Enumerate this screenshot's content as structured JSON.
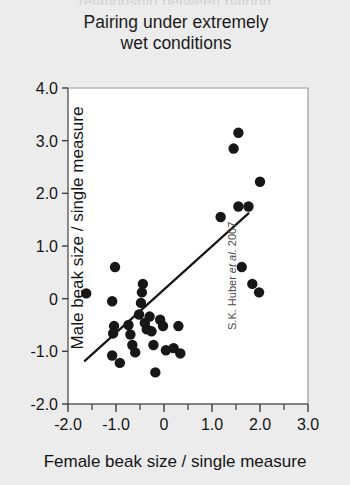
{
  "figure": {
    "clipped_header": "relationship between pairing",
    "title_line1": "Pairing under extremely",
    "title_line2": "wet conditions",
    "attribution_prefix": "S.K. Huber ",
    "attribution_italic": "et al.",
    "attribution_suffix": " 2007",
    "background_color": "#ececed",
    "plot_background_color": "#ffffff",
    "point_color": "#171717",
    "line_color": "#151515"
  },
  "chart_data": {
    "type": "scatter",
    "title": "Pairing under extremely wet conditions",
    "xlabel": "Female beak size / single measure",
    "ylabel": "Male beak size / single measure",
    "xlim": [
      -2.0,
      3.0
    ],
    "ylim": [
      -2.0,
      4.0
    ],
    "xticks": [
      -2.0,
      -1.5,
      -1.0,
      -0.5,
      0,
      0.5,
      1.0,
      1.5,
      2.0,
      2.5,
      3.0
    ],
    "xtick_labels": [
      "-2.0",
      "",
      "-1.0",
      "",
      "0",
      "",
      "1.0",
      "",
      "2.0",
      "",
      "3.0"
    ],
    "yticks": [
      -2.0,
      -1.0,
      0,
      1.0,
      2.0,
      3.0,
      4.0
    ],
    "ytick_labels": [
      "-2.0",
      "-1.0",
      "0",
      "1.0",
      "2.0",
      "3.0",
      "4.0"
    ],
    "grid": false,
    "legend": null,
    "annotation": "S.K. Huber et al. 2007",
    "point_radius": 5.2,
    "points": [
      {
        "x": -1.62,
        "y": 0.1
      },
      {
        "x": -1.02,
        "y": 0.6
      },
      {
        "x": -1.08,
        "y": -0.05
      },
      {
        "x": -1.04,
        "y": -0.52
      },
      {
        "x": -1.06,
        "y": -0.66
      },
      {
        "x": -1.08,
        "y": -1.08
      },
      {
        "x": -0.92,
        "y": -1.22
      },
      {
        "x": -0.74,
        "y": -0.5
      },
      {
        "x": -0.7,
        "y": -0.68
      },
      {
        "x": -0.66,
        "y": -0.88
      },
      {
        "x": -0.6,
        "y": -1.02
      },
      {
        "x": -0.52,
        "y": -0.3
      },
      {
        "x": -0.48,
        "y": -0.08
      },
      {
        "x": -0.46,
        "y": 0.12
      },
      {
        "x": -0.44,
        "y": 0.28
      },
      {
        "x": -0.4,
        "y": -0.46
      },
      {
        "x": -0.36,
        "y": -0.58
      },
      {
        "x": -0.3,
        "y": -0.34
      },
      {
        "x": -0.26,
        "y": -0.62
      },
      {
        "x": -0.22,
        "y": -0.88
      },
      {
        "x": -0.18,
        "y": -1.4
      },
      {
        "x": -0.08,
        "y": -0.4
      },
      {
        "x": -0.02,
        "y": -0.52
      },
      {
        "x": 0.04,
        "y": -0.98
      },
      {
        "x": 0.2,
        "y": -0.94
      },
      {
        "x": 0.3,
        "y": -0.52
      },
      {
        "x": 0.34,
        "y": -1.04
      },
      {
        "x": 1.18,
        "y": 1.55
      },
      {
        "x": 1.45,
        "y": 2.85
      },
      {
        "x": 1.55,
        "y": 3.15
      },
      {
        "x": 1.55,
        "y": 1.75
      },
      {
        "x": 1.76,
        "y": 1.75
      },
      {
        "x": 1.62,
        "y": 0.6
      },
      {
        "x": 1.84,
        "y": 0.28
      },
      {
        "x": 1.98,
        "y": 0.12
      },
      {
        "x": 2.0,
        "y": 2.22
      }
    ],
    "trendline": {
      "x_start": -1.65,
      "y_start": -1.18,
      "x_end": 1.76,
      "y_end": 1.62
    }
  }
}
